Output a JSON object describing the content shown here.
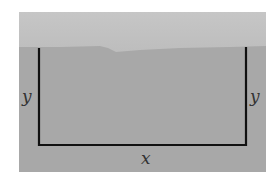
{
  "diagram": {
    "labels": {
      "left_side": "y",
      "right_side": "y",
      "bottom_side": "x"
    },
    "colors": {
      "sky": "#c2c2c2",
      "ground": "#a9a9a9",
      "fence": "#111111",
      "label": "#333333"
    }
  }
}
